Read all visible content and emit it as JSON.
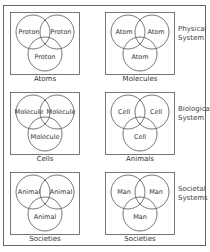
{
  "diagram": {
    "rows": [
      {
        "system_label": "Physical\nSystem",
        "panels": [
          {
            "circles": [
              "Proton",
              "Proton",
              "Proton"
            ],
            "caption": "Atoms"
          },
          {
            "circles": [
              "Atom",
              "Atom",
              "Atom"
            ],
            "caption": "Molecules"
          }
        ]
      },
      {
        "system_label": "Biological\nSystem",
        "panels": [
          {
            "circles": [
              "Molecule",
              "Molecule",
              "Molecule"
            ],
            "caption": "Cells"
          },
          {
            "circles": [
              "Cell",
              "Cell",
              "Cell"
            ],
            "caption": "Animals"
          }
        ]
      },
      {
        "system_label": "Societal\nSystems",
        "panels": [
          {
            "circles": [
              "Animal",
              "Animal",
              "Animal"
            ],
            "caption": "Societies"
          },
          {
            "circles": [
              "Man",
              "Man",
              "Man"
            ],
            "caption": "Societies"
          }
        ]
      }
    ]
  },
  "colors": {
    "stroke": "#555555",
    "text": "#333333",
    "background": "#ffffff"
  }
}
